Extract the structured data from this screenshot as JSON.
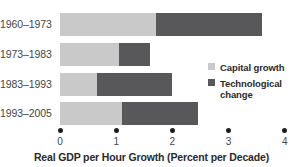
{
  "chart_data": {
    "type": "bar",
    "orientation": "horizontal",
    "stacked": true,
    "title": "",
    "xlabel": "Real GDP per Hour Growth (Percent per Decade)",
    "ylabel": "",
    "categories": [
      "1960–1973",
      "1973–1983",
      "1983–1993",
      "1993–2005"
    ],
    "series": [
      {
        "name": "Capital growth",
        "color": "#c9c9c9",
        "values": [
          1.7,
          1.05,
          0.65,
          1.1
        ]
      },
      {
        "name": "Technological change",
        "color": "#58585a",
        "values": [
          1.9,
          0.55,
          1.35,
          1.35
        ]
      }
    ],
    "totals": [
      3.6,
      1.6,
      2.0,
      2.45
    ],
    "xlim": [
      0,
      4
    ],
    "xticks": [
      0,
      1,
      2,
      3,
      4
    ],
    "xtick_labels": [
      "0",
      "1",
      "2",
      "3",
      "4"
    ],
    "grid": false,
    "legend_position": "right"
  },
  "axis": {
    "title": "Real GDP per Hour Growth (Percent per Decade)",
    "ticks": [
      {
        "label": "0",
        "value": 0
      },
      {
        "label": "1",
        "value": 1
      },
      {
        "label": "2",
        "value": 2
      },
      {
        "label": "3",
        "value": 3
      },
      {
        "label": "4",
        "value": 4
      }
    ]
  },
  "legend": {
    "items": [
      {
        "label": "Capital growth",
        "color": "#c9c9c9"
      },
      {
        "label": "Technological change",
        "color": "#58585a"
      }
    ]
  },
  "rows": [
    {
      "label": "1960–1973",
      "capital": 1.7,
      "tech": 1.9
    },
    {
      "label": "1973–1983",
      "capital": 1.05,
      "tech": 0.55
    },
    {
      "label": "1983–1993",
      "capital": 0.65,
      "tech": 1.35
    },
    {
      "label": "1993–2005",
      "capital": 1.1,
      "tech": 1.35
    }
  ]
}
